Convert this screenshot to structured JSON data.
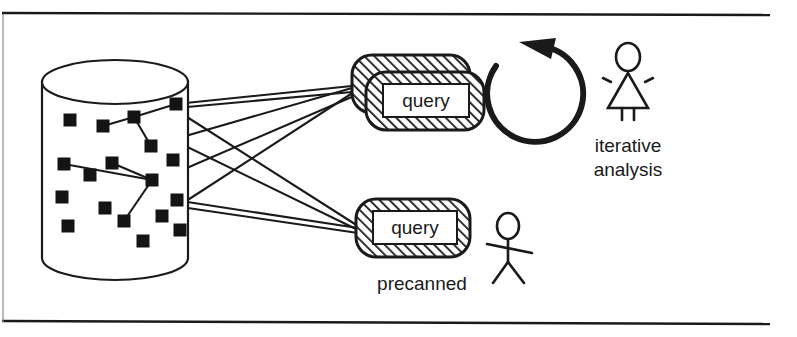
{
  "figure": {
    "frame": {
      "top_rule_y": 13,
      "bottom_rule_y": 322,
      "left_rule_x": 3,
      "rule_color": "#1a1a1a"
    },
    "database": {
      "name": "database-cylinder",
      "center_x": 115,
      "top_y": 60,
      "bottom_y": 258,
      "radius_x": 73,
      "radius_y": 22,
      "record_count": 20,
      "record_size": 13,
      "records": [
        {
          "x": 70,
          "y": 120
        },
        {
          "x": 103,
          "y": 126
        },
        {
          "x": 134,
          "y": 117
        },
        {
          "x": 176,
          "y": 104
        },
        {
          "x": 151,
          "y": 146
        },
        {
          "x": 64,
          "y": 164
        },
        {
          "x": 112,
          "y": 163
        },
        {
          "x": 173,
          "y": 160
        },
        {
          "x": 90,
          "y": 175
        },
        {
          "x": 152,
          "y": 180
        },
        {
          "x": 62,
          "y": 197
        },
        {
          "x": 105,
          "y": 208
        },
        {
          "x": 177,
          "y": 200
        },
        {
          "x": 124,
          "y": 221
        },
        {
          "x": 162,
          "y": 216
        },
        {
          "x": 68,
          "y": 226
        },
        {
          "x": 180,
          "y": 230
        },
        {
          "x": 143,
          "y": 241
        },
        {
          "x": 97,
          "y": 137
        },
        {
          "x": 189,
          "y": 180
        }
      ],
      "internal_links": [
        {
          "x1": 103,
          "y1": 126,
          "x2": 134,
          "y2": 117
        },
        {
          "x1": 134,
          "y1": 117,
          "x2": 176,
          "y2": 104
        },
        {
          "x1": 134,
          "y1": 117,
          "x2": 151,
          "y2": 146
        },
        {
          "x1": 64,
          "y1": 164,
          "x2": 152,
          "y2": 180
        },
        {
          "x1": 152,
          "y1": 180,
          "x2": 124,
          "y2": 221
        },
        {
          "x1": 152,
          "y1": 180,
          "x2": 112,
          "y2": 163
        }
      ]
    },
    "connections": [
      {
        "name": "record-to-iterative-1",
        "x1": 176,
        "y1": 104,
        "x2": 352,
        "y2": 88
      },
      {
        "name": "record-to-iterative-2",
        "x1": 151,
        "y1": 146,
        "x2": 352,
        "y2": 88
      },
      {
        "name": "record-to-iterative-3",
        "x1": 177,
        "y1": 200,
        "x2": 352,
        "y2": 88
      },
      {
        "name": "record-to-iterative-4",
        "x1": 152,
        "y1": 180,
        "x2": 352,
        "y2": 90
      },
      {
        "name": "record-to-precanned-1",
        "x1": 176,
        "y1": 104,
        "x2": 358,
        "y2": 228
      },
      {
        "name": "record-to-precanned-2",
        "x1": 134,
        "y1": 117,
        "x2": 358,
        "y2": 228
      },
      {
        "name": "record-to-precanned-3",
        "x1": 177,
        "y1": 200,
        "x2": 358,
        "y2": 228
      }
    ],
    "queries": [
      {
        "name": "iterative-query-stack",
        "label": "query",
        "stacked": true,
        "back": {
          "x": 352,
          "y": 55,
          "w": 118,
          "h": 58,
          "r": 20
        },
        "front": {
          "x": 366,
          "y": 72,
          "w": 118,
          "h": 58,
          "r": 20
        },
        "text_box": {
          "x": 383,
          "y": 83,
          "w": 84,
          "h": 32
        }
      },
      {
        "name": "precanned-query",
        "label": "query",
        "stacked": false,
        "front": {
          "x": 356,
          "y": 199,
          "w": 113,
          "h": 58,
          "r": 20
        },
        "text_box": {
          "x": 372,
          "y": 211,
          "w": 82,
          "h": 32
        }
      }
    ],
    "loop_arrow": {
      "name": "iteration-loop-arrow",
      "center_x": 532,
      "center_y": 92,
      "radius": 48
    },
    "actors": [
      {
        "name": "female-actor",
        "kind": "female-stick-figure",
        "x": 628,
        "y": 45,
        "caption_lines": [
          "iterative",
          "analysis"
        ],
        "caption_x": 628,
        "caption_y": 152
      },
      {
        "name": "male-actor",
        "kind": "male-stick-figure",
        "x": 508,
        "y": 215,
        "caption_lines": [
          "precanned"
        ],
        "caption_x": 422,
        "caption_y": 290
      }
    ],
    "colors": {
      "ink": "#1a1a1a",
      "paper": "#ffffff",
      "record_fill": "#141414",
      "hatch": "#1a1a1a"
    }
  }
}
